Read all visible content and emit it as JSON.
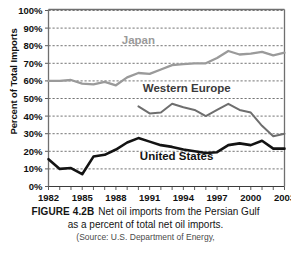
{
  "chart_data": {
    "type": "line",
    "title": "",
    "xlabel": "",
    "ylabel": "Percent of Total Imports",
    "xlim": [
      1982,
      2003
    ],
    "ylim": [
      0,
      100
    ],
    "grid": true,
    "legend_position": "inline-labels",
    "x": [
      1982,
      1983,
      1984,
      1985,
      1986,
      1987,
      1988,
      1989,
      1990,
      1991,
      1992,
      1993,
      1994,
      1995,
      1996,
      1997,
      1998,
      1999,
      2000,
      2001,
      2002,
      2003
    ],
    "x_tick_labels": [
      "1982",
      "1985",
      "1988",
      "1991",
      "1994",
      "1997",
      "2000",
      "2003"
    ],
    "x_tick_values": [
      1982,
      1985,
      1988,
      1991,
      1994,
      1997,
      2000,
      2003
    ],
    "y_tick_labels": [
      "0%",
      "10%",
      "20%",
      "30%",
      "40%",
      "50%",
      "60%",
      "70%",
      "80%",
      "90%",
      "100%"
    ],
    "y_tick_values": [
      0,
      10,
      20,
      30,
      40,
      50,
      60,
      70,
      80,
      90,
      100
    ],
    "series": [
      {
        "name": "Japan",
        "color": "#9a9a9a",
        "label_color": "#9a9a9a",
        "x": [
          1982,
          1983,
          1984,
          1985,
          1986,
          1987,
          1988,
          1989,
          1990,
          1991,
          1992,
          1993,
          1994,
          1995,
          1996,
          1997,
          1998,
          1999,
          2000,
          2001,
          2002,
          2003
        ],
        "values": [
          60,
          60,
          60.5,
          58.5,
          58,
          59.5,
          57.5,
          62,
          64.5,
          64,
          66.5,
          69,
          69.5,
          70,
          70,
          73,
          77,
          75,
          75.5,
          76.5,
          74.5,
          76
        ]
      },
      {
        "name": "Western Europe",
        "color": "#6e6e6e",
        "label_color": "#3a3a3a",
        "x": [
          1990,
          1991,
          1992,
          1993,
          1994,
          1995,
          1996,
          1997,
          1998,
          1999,
          2000,
          2001,
          2002,
          2003
        ],
        "values": [
          45.5,
          41.5,
          42,
          47,
          45,
          43.5,
          40,
          43.5,
          47,
          43.5,
          42,
          34.5,
          28.5,
          30
        ]
      },
      {
        "name": "United States",
        "color": "#131313",
        "label_color": "#131313",
        "x": [
          1982,
          1983,
          1984,
          1985,
          1986,
          1987,
          1988,
          1989,
          1990,
          1991,
          1992,
          1993,
          1994,
          1995,
          1996,
          1997,
          1998,
          1999,
          2000,
          2001,
          2002,
          2003
        ],
        "values": [
          15.5,
          10,
          10.5,
          7,
          17,
          18,
          21,
          25,
          27.5,
          25.5,
          23.5,
          22.5,
          21,
          20,
          19,
          19.5,
          23.5,
          24.5,
          23.5,
          26,
          21.5,
          21.5
        ]
      }
    ],
    "annotations": [
      {
        "text": "Japan",
        "x": 1990,
        "y": 81
      },
      {
        "text": "Western Europe",
        "x": 1994.3,
        "y": 53.5
      },
      {
        "text": "United States",
        "x": 1993.4,
        "y": 15
      }
    ]
  },
  "caption": {
    "figure_number": "FIGURE 4.2B",
    "line1": "Net oil imports from the Persian Gulf",
    "line2": "as a percent of total net oil imports.",
    "source": "(Source: U.S. Department of Energy,"
  }
}
